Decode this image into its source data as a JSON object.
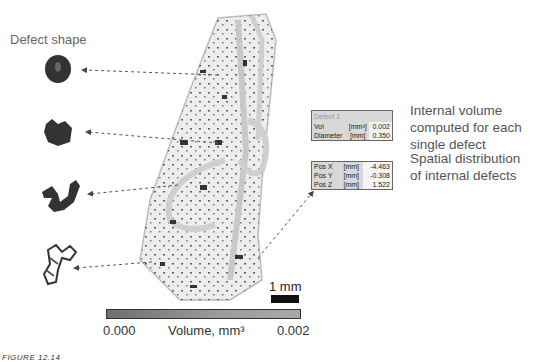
{
  "figure": {
    "left_heading": "Defect shape",
    "right_annotations": [
      {
        "lines": [
          "Internal volume",
          "computed for each",
          "single defect"
        ]
      },
      {
        "lines": [
          "Spatial distribution",
          "of internal defects"
        ]
      }
    ],
    "info_panel": {
      "title": "Defect 1",
      "rows_top": [
        {
          "name": "Vol",
          "unit": "[mm³]",
          "value": "0.002"
        },
        {
          "name": "Diameter",
          "unit": "[mm]",
          "value": "0.350"
        }
      ],
      "rows_bottom": [
        {
          "name": "Pos X",
          "unit": "[mm]",
          "value": "-4.463"
        },
        {
          "name": "Pos Y",
          "unit": "[mm]",
          "value": "-0.308"
        },
        {
          "name": "Pos Z",
          "unit": "[mm]",
          "value": "1.522"
        }
      ]
    },
    "scale": {
      "label": "1 mm"
    },
    "colorbar": {
      "min": "0.000",
      "max": "0.002",
      "label": "Volume, mm³"
    },
    "caption": "FIGURE 12.14"
  }
}
